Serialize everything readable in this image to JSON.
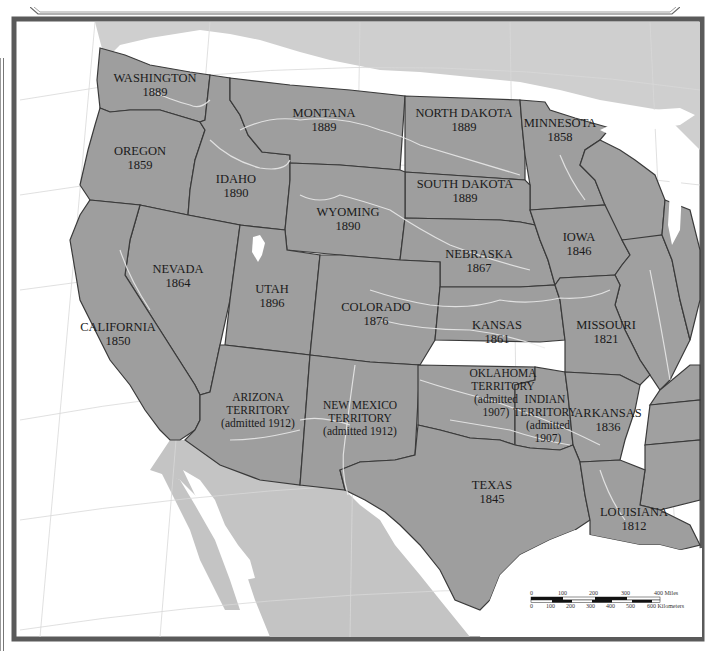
{
  "map": {
    "title": "",
    "colors": {
      "state_fill": "#9e9e9e",
      "border": "#3a3a3a",
      "frame": "#5a5a5a",
      "water": "#ffffff",
      "foreign_land": "#c4c4c4"
    },
    "states": [
      {
        "id": "washington",
        "name": "WASHINGTON",
        "year": "1889"
      },
      {
        "id": "oregon",
        "name": "OREGON",
        "year": "1859"
      },
      {
        "id": "idaho",
        "name": "IDAHO",
        "year": "1890"
      },
      {
        "id": "montana",
        "name": "MONTANA",
        "year": "1889"
      },
      {
        "id": "north-dakota",
        "name": "NORTH DAKOTA",
        "year": "1889"
      },
      {
        "id": "minnesota",
        "name": "MINNESOTA",
        "year": "1858"
      },
      {
        "id": "south-dakota",
        "name": "SOUTH DAKOTA",
        "year": "1889"
      },
      {
        "id": "wyoming",
        "name": "WYOMING",
        "year": "1890"
      },
      {
        "id": "iowa",
        "name": "IOWA",
        "year": "1846"
      },
      {
        "id": "nebraska",
        "name": "NEBRASKA",
        "year": "1867"
      },
      {
        "id": "nevada",
        "name": "NEVADA",
        "year": "1864"
      },
      {
        "id": "utah",
        "name": "UTAH",
        "year": "1896"
      },
      {
        "id": "colorado",
        "name": "COLORADO",
        "year": "1876"
      },
      {
        "id": "california",
        "name": "CALIFORNIA",
        "year": "1850"
      },
      {
        "id": "kansas",
        "name": "KANSAS",
        "year": "1861"
      },
      {
        "id": "missouri",
        "name": "MISSOURI",
        "year": "1821"
      },
      {
        "id": "arizona",
        "name": "ARIZONA",
        "line2": "TERRITORY",
        "year": "(admitted 1912)"
      },
      {
        "id": "new-mexico",
        "name": "NEW MEXICO",
        "line2": "TERRITORY",
        "year": "(admitted 1912)"
      },
      {
        "id": "oklahoma",
        "name": "OKLAHOMA",
        "line2": "TERRITORY",
        "line3": "(admitted",
        "year": "1907)"
      },
      {
        "id": "indian-territory",
        "name": "INDIAN",
        "line2": "TERRITORY",
        "line3": "(admitted",
        "year": "1907)"
      },
      {
        "id": "arkansas",
        "name": "ARKANSAS",
        "year": "1836"
      },
      {
        "id": "texas",
        "name": "TEXAS",
        "year": "1845"
      },
      {
        "id": "louisiana",
        "name": "LOUISIANA",
        "year": "1812"
      }
    ],
    "scale_bar": {
      "miles_ticks": [
        "0",
        "100",
        "200",
        "300",
        "400 Miles"
      ],
      "km_ticks": [
        "0",
        "100",
        "200",
        "300",
        "400",
        "500",
        "600 Kilometers"
      ]
    }
  }
}
